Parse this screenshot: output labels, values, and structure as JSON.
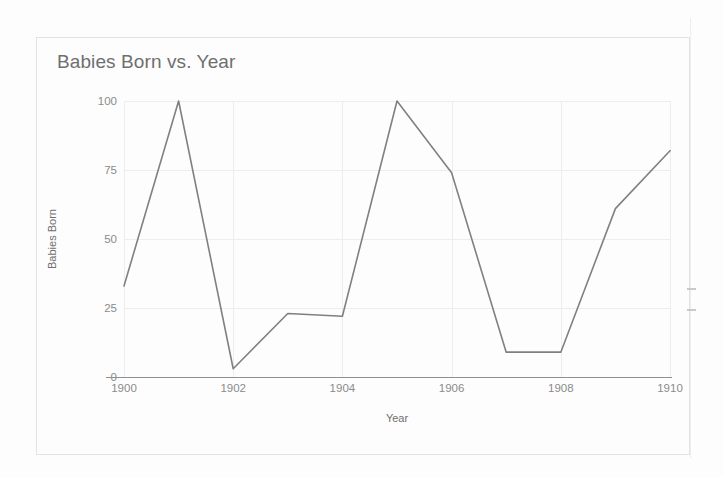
{
  "chart": {
    "title": "Babies Born vs. Year",
    "xlabel": "Year",
    "ylabel": "Babies Born"
  },
  "chart_data": {
    "type": "line",
    "title": "Babies Born vs. Year",
    "xlabel": "Year",
    "ylabel": "Babies Born",
    "x": [
      1900,
      1901,
      1902,
      1903,
      1904,
      1905,
      1906,
      1907,
      1908,
      1909,
      1910
    ],
    "values": [
      33,
      100,
      3,
      23,
      22,
      100,
      74,
      9,
      9,
      61,
      82
    ],
    "series": [
      {
        "name": "Babies Born",
        "color": "#808080",
        "values": [
          33,
          100,
          3,
          23,
          22,
          100,
          74,
          9,
          9,
          61,
          82
        ]
      }
    ],
    "xlim": [
      1900,
      1910
    ],
    "ylim": [
      0,
      100
    ],
    "xticks": [
      1900,
      1902,
      1904,
      1906,
      1908,
      1910
    ],
    "yticks": [
      0,
      25,
      50,
      75,
      100
    ],
    "xtick_labels": [
      "1900",
      "1902",
      "1904",
      "1906",
      "1908",
      "1910"
    ],
    "ytick_labels": [
      "0",
      "25",
      "50",
      "75",
      "100"
    ],
    "grid": true,
    "legend": false,
    "legend_position": "none"
  },
  "colors": {
    "series_line": "#808080",
    "gridline": "#ededed",
    "axis_text": "#8b8b8b",
    "title_text": "#6f6f6f",
    "card_border": "#e3e3e3",
    "axis_line": "#8f8f8f"
  }
}
